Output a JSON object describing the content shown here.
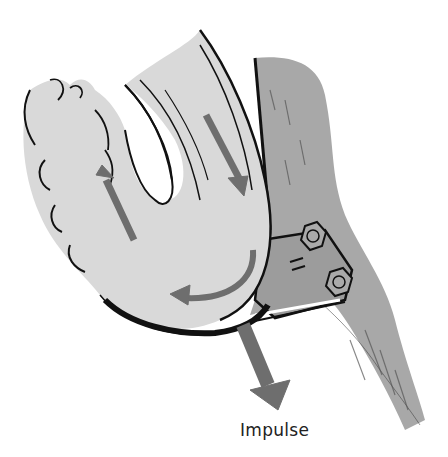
{
  "figure": {
    "caption": "Impulse",
    "colors": {
      "water": "#d9d9d9",
      "bracket": "#a8a8a8",
      "arrow": "#6e6e6e",
      "outline": "#111111"
    },
    "arrows": [
      {
        "name": "inflow-arrow",
        "direction": "down"
      },
      {
        "name": "turning-arrow",
        "direction": "curved-left"
      },
      {
        "name": "outflow-arrow",
        "direction": "up"
      },
      {
        "name": "impulse-arrow",
        "direction": "down-right"
      }
    ]
  }
}
